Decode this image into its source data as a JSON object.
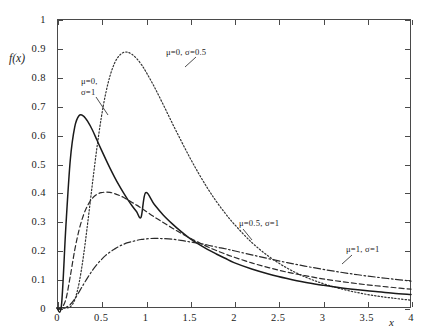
{
  "chart_data": {
    "type": "line",
    "title": "",
    "xlabel": "x",
    "ylabel": "f(x)",
    "xlim": [
      0,
      4
    ],
    "ylim": [
      0,
      1
    ],
    "grid": false,
    "legend_position": "inline-annotations",
    "x_ticks": [
      "0",
      "0.5",
      "1",
      "1.5",
      "2",
      "2.5",
      "3",
      "3.5",
      "4"
    ],
    "x_tick_values": [
      0,
      0.5,
      1,
      1.5,
      2,
      2.5,
      3,
      3.5,
      4
    ],
    "y_ticks": [
      "0",
      "0.1",
      "0.2",
      "0.3",
      "0.4",
      "0.5",
      "0.6",
      "0.7",
      "0.8",
      "0.9",
      "1"
    ],
    "y_tick_values": [
      0,
      0.1,
      0.2,
      0.3,
      0.4,
      0.5,
      0.6,
      0.7,
      0.8,
      0.9,
      1
    ],
    "series": [
      {
        "name": "mu=0, sigma=0.5",
        "label": "μ=0, σ=0.5",
        "mu": 0,
        "sigma": 0.5,
        "style": "dotted",
        "color": "#333333",
        "peak_x": 0.78,
        "peak_y": 0.91,
        "values": [
          [
            0.0,
            0.0
          ],
          [
            0.05,
            0.0
          ],
          [
            0.1,
            0.0
          ],
          [
            0.15,
            0.004
          ],
          [
            0.2,
            0.028
          ],
          [
            0.25,
            0.087
          ],
          [
            0.3,
            0.182
          ],
          [
            0.35,
            0.302
          ],
          [
            0.4,
            0.43
          ],
          [
            0.45,
            0.552
          ],
          [
            0.5,
            0.658
          ],
          [
            0.55,
            0.742
          ],
          [
            0.6,
            0.804
          ],
          [
            0.65,
            0.847
          ],
          [
            0.7,
            0.872
          ],
          [
            0.75,
            0.884
          ],
          [
            0.8,
            0.885
          ],
          [
            0.85,
            0.877
          ],
          [
            0.9,
            0.863
          ],
          [
            0.95,
            0.844
          ],
          [
            1.0,
            0.82
          ],
          [
            1.1,
            0.765
          ],
          [
            1.2,
            0.704
          ],
          [
            1.3,
            0.641
          ],
          [
            1.4,
            0.58
          ],
          [
            1.5,
            0.521
          ],
          [
            1.6,
            0.466
          ],
          [
            1.7,
            0.415
          ],
          [
            1.8,
            0.369
          ],
          [
            1.9,
            0.328
          ],
          [
            2.0,
            0.291
          ],
          [
            2.2,
            0.227
          ],
          [
            2.4,
            0.177
          ],
          [
            2.6,
            0.138
          ],
          [
            2.8,
            0.108
          ],
          [
            3.0,
            0.085
          ],
          [
            3.2,
            0.067
          ],
          [
            3.4,
            0.053
          ],
          [
            3.6,
            0.042
          ],
          [
            3.8,
            0.034
          ],
          [
            4.0,
            0.027
          ]
        ]
      },
      {
        "name": "mu=0, sigma=1",
        "label": "μ=0, σ=1",
        "mu": 0,
        "sigma": 1,
        "style": "solid",
        "color": "#1a1a1a",
        "peak_x": 0.37,
        "peak_y": 0.66,
        "values": [
          [
            0.0,
            0.0
          ],
          [
            0.05,
            0.008
          ],
          [
            0.1,
            0.281
          ],
          [
            0.15,
            0.512
          ],
          [
            0.2,
            0.626
          ],
          [
            0.25,
            0.666
          ],
          [
            0.3,
            0.664
          ],
          [
            0.35,
            0.644
          ],
          [
            0.4,
            0.616
          ],
          [
            0.45,
            0.582
          ],
          [
            0.5,
            0.548
          ],
          [
            0.55,
            0.515
          ],
          [
            0.6,
            0.483
          ],
          [
            0.65,
            0.453
          ],
          [
            0.7,
            0.425
          ],
          [
            0.75,
            0.399
          ],
          [
            0.8,
            0.375
          ],
          [
            0.85,
            0.353
          ],
          [
            0.9,
            0.333
          ],
          [
            0.95,
            0.314
          ],
          [
            1.0,
            0.399
          ],
          [
            1.1,
            0.358
          ],
          [
            1.2,
            0.322
          ],
          [
            1.3,
            0.292
          ],
          [
            1.4,
            0.265
          ],
          [
            1.5,
            0.241
          ],
          [
            1.6,
            0.221
          ],
          [
            1.7,
            0.203
          ],
          [
            1.8,
            0.187
          ],
          [
            1.9,
            0.172
          ],
          [
            2.0,
            0.157
          ],
          [
            2.2,
            0.135
          ],
          [
            2.4,
            0.117
          ],
          [
            2.6,
            0.102
          ],
          [
            2.8,
            0.089
          ],
          [
            3.0,
            0.079
          ],
          [
            3.2,
            0.07
          ],
          [
            3.4,
            0.063
          ],
          [
            3.6,
            0.057
          ],
          [
            3.8,
            0.051
          ],
          [
            4.0,
            0.047
          ]
        ]
      },
      {
        "name": "mu=0.5, sigma=1",
        "label": "μ=0.5, σ=1",
        "mu": 0.5,
        "sigma": 1,
        "style": "dashed",
        "color": "#2a2a2a",
        "peak_x": 0.6,
        "peak_y": 0.4,
        "values": [
          [
            0.0,
            0.0
          ],
          [
            0.05,
            0.0
          ],
          [
            0.1,
            0.03
          ],
          [
            0.15,
            0.11
          ],
          [
            0.2,
            0.2
          ],
          [
            0.25,
            0.271
          ],
          [
            0.3,
            0.322
          ],
          [
            0.35,
            0.357
          ],
          [
            0.4,
            0.38
          ],
          [
            0.45,
            0.393
          ],
          [
            0.5,
            0.399
          ],
          [
            0.55,
            0.401
          ],
          [
            0.6,
            0.4
          ],
          [
            0.65,
            0.396
          ],
          [
            0.7,
            0.39
          ],
          [
            0.75,
            0.383
          ],
          [
            0.8,
            0.374
          ],
          [
            0.85,
            0.365
          ],
          [
            0.9,
            0.356
          ],
          [
            0.95,
            0.346
          ],
          [
            1.0,
            0.336
          ],
          [
            1.1,
            0.315
          ],
          [
            1.2,
            0.296
          ],
          [
            1.3,
            0.277
          ],
          [
            1.4,
            0.259
          ],
          [
            1.5,
            0.242
          ],
          [
            1.6,
            0.227
          ],
          [
            1.7,
            0.212
          ],
          [
            1.8,
            0.199
          ],
          [
            1.9,
            0.187
          ],
          [
            2.0,
            0.176
          ],
          [
            2.2,
            0.156
          ],
          [
            2.4,
            0.139
          ],
          [
            2.6,
            0.124
          ],
          [
            2.8,
            0.112
          ],
          [
            3.0,
            0.101
          ],
          [
            3.2,
            0.092
          ],
          [
            3.4,
            0.084
          ],
          [
            3.6,
            0.077
          ],
          [
            3.8,
            0.071
          ],
          [
            4.0,
            0.065
          ]
        ]
      },
      {
        "name": "mu=1, sigma=1",
        "label": "μ=1, σ=1",
        "mu": 1,
        "sigma": 1,
        "style": "dashdot",
        "color": "#2a2a2a",
        "peak_x": 1.05,
        "peak_y": 0.24,
        "values": [
          [
            0.0,
            0.0
          ],
          [
            0.05,
            0.0
          ],
          [
            0.1,
            0.002
          ],
          [
            0.15,
            0.012
          ],
          [
            0.2,
            0.031
          ],
          [
            0.25,
            0.056
          ],
          [
            0.3,
            0.082
          ],
          [
            0.35,
            0.107
          ],
          [
            0.4,
            0.13
          ],
          [
            0.45,
            0.15
          ],
          [
            0.5,
            0.167
          ],
          [
            0.55,
            0.182
          ],
          [
            0.6,
            0.194
          ],
          [
            0.65,
            0.204
          ],
          [
            0.7,
            0.213
          ],
          [
            0.75,
            0.22
          ],
          [
            0.8,
            0.226
          ],
          [
            0.85,
            0.23
          ],
          [
            0.9,
            0.234
          ],
          [
            0.95,
            0.237
          ],
          [
            1.0,
            0.239
          ],
          [
            1.1,
            0.241
          ],
          [
            1.2,
            0.24
          ],
          [
            1.3,
            0.238
          ],
          [
            1.4,
            0.234
          ],
          [
            1.5,
            0.229
          ],
          [
            1.6,
            0.224
          ],
          [
            1.7,
            0.218
          ],
          [
            1.8,
            0.211
          ],
          [
            1.9,
            0.205
          ],
          [
            2.0,
            0.198
          ],
          [
            2.2,
            0.184
          ],
          [
            2.4,
            0.17
          ],
          [
            2.6,
            0.157
          ],
          [
            2.8,
            0.145
          ],
          [
            3.0,
            0.134
          ],
          [
            3.2,
            0.124
          ],
          [
            3.4,
            0.115
          ],
          [
            3.6,
            0.107
          ],
          [
            3.8,
            0.1
          ],
          [
            4.0,
            0.093
          ]
        ]
      }
    ],
    "annotations": [
      {
        "id": "ann-sigma-half",
        "text": "μ=0, σ=0.5",
        "x_px": 166,
        "y_px": 47
      },
      {
        "id": "ann-mu0-line1",
        "text": "μ=0,",
        "x_px": 81,
        "y_px": 76
      },
      {
        "id": "ann-mu0-line2",
        "text": "σ=1",
        "x_px": 81,
        "y_px": 87
      },
      {
        "id": "ann-mu-half",
        "text": "μ=0.5, σ=1",
        "x_px": 239,
        "y_px": 218
      },
      {
        "id": "ann-mu-one",
        "text": "μ=1, σ=1",
        "x_px": 346,
        "y_px": 244
      }
    ]
  }
}
